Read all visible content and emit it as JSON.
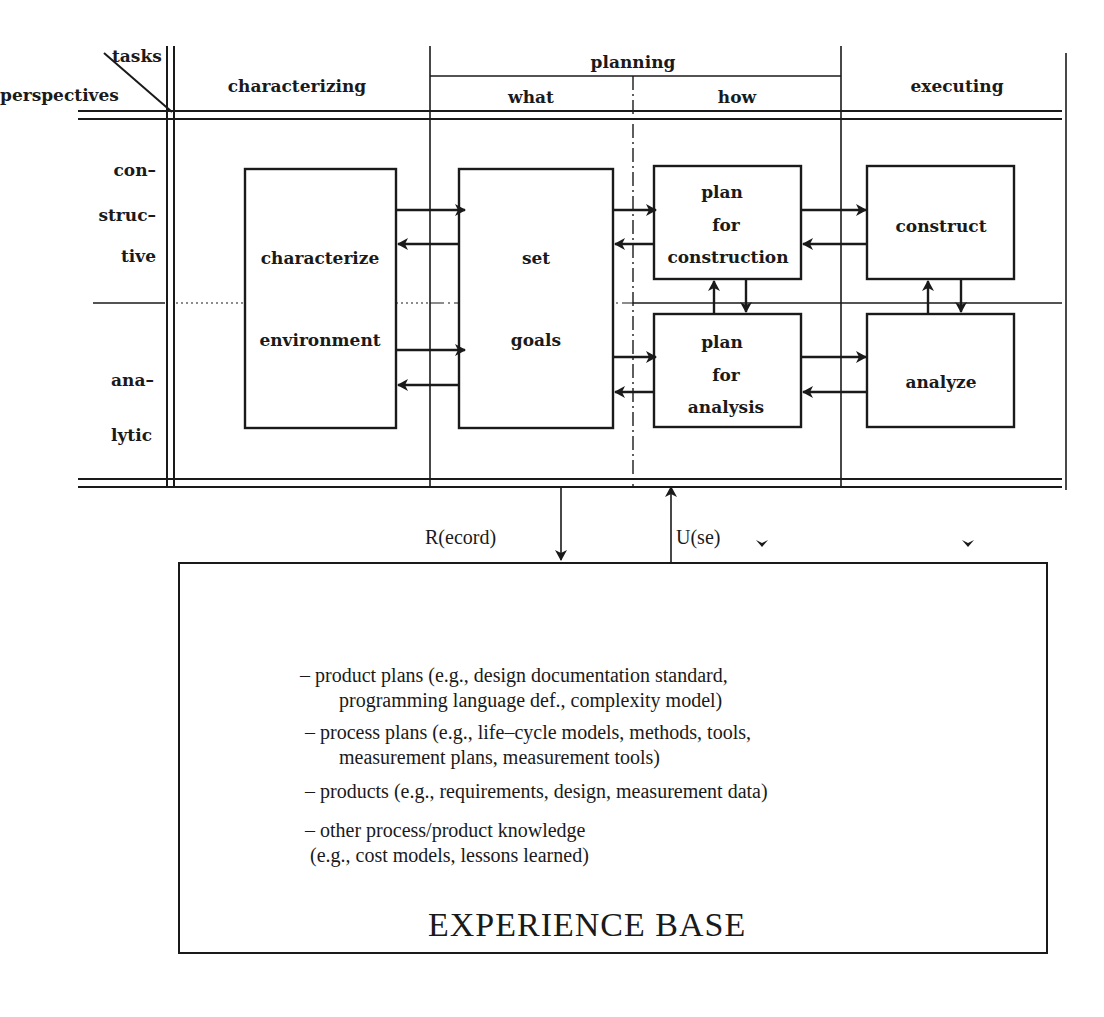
{
  "header": {
    "corner_top": "tasks",
    "corner_bottom": "perspectives",
    "col_characterizing": "characterizing",
    "col_planning": "planning",
    "col_what": "what",
    "col_how": "how",
    "col_executing": "executing"
  },
  "rows": {
    "constructive": [
      "con–",
      "struc–",
      "tive"
    ],
    "analytic": [
      "ana–",
      "lytic"
    ]
  },
  "boxes": {
    "characterize_environment": {
      "line1": "characterize",
      "line2": "environment"
    },
    "set_goals": {
      "line1": "set",
      "line2": "goals"
    },
    "plan_construction": {
      "line1": "plan",
      "line2": "for",
      "line3": "construction"
    },
    "plan_analysis": {
      "line1": "plan",
      "line2": "for",
      "line3": "analysis"
    },
    "construct": {
      "label": "construct"
    },
    "analyze": {
      "label": "analyze"
    }
  },
  "flows": {
    "record": "R(ecord)",
    "use": "U(se)"
  },
  "experience_base": {
    "title": "EXPERIENCE BASE",
    "items": [
      {
        "line1": "– product plans (e.g., design documentation standard,",
        "line2": "programming language def., complexity model)"
      },
      {
        "line1": "– process plans (e.g., life–cycle models, methods, tools,",
        "line2": "measurement plans, measurement tools)"
      },
      {
        "line1": "– products (e.g., requirements, design, measurement data)",
        "line2": ""
      },
      {
        "line1": "– other process/product knowledge",
        "line2": "(e.g., cost models, lessons learned)"
      }
    ]
  },
  "colors": {
    "ink": "#1a1a1a",
    "background": "#ffffff"
  }
}
